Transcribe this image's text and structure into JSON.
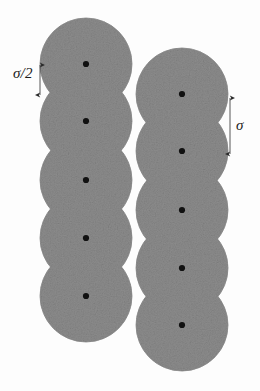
{
  "figure": {
    "canvas": {
      "width": 260,
      "height": 391,
      "background": "#fdfdfd"
    },
    "sphere": {
      "radius": 46,
      "fill_color": "#8c8c8c",
      "edge_color": "#8c8c8c",
      "center_dot_color": "#111111",
      "center_dot_radius": 3.1,
      "texture": "speckled-gray-noise"
    },
    "chains": [
      {
        "name": "left-chain",
        "center_x": 86,
        "bond_length": 58,
        "sphere_count": 5,
        "centers_y": [
          64,
          121,
          180,
          238,
          296
        ]
      },
      {
        "name": "right-chain",
        "center_x": 182,
        "bond_length": 58,
        "sphere_count": 5,
        "offset_from_left_chain_y": 30,
        "centers_y": [
          94,
          151,
          210,
          268,
          325
        ]
      }
    ],
    "annotations": [
      {
        "name": "sigma-half-dimension",
        "label": "σ/2",
        "meaning": "half the sphere diameter, bond overlap spacing",
        "label_x": 13,
        "label_y": 66,
        "line_x": 40,
        "line_y_top": 64,
        "line_y_bottom": 96,
        "color": "#2b2b2b",
        "arrowheads": "both"
      },
      {
        "name": "sigma-dimension",
        "label": "σ",
        "meaning": "sphere diameter",
        "label_x": 236,
        "label_y": 118,
        "line_x": 230,
        "line_y_top": 97,
        "line_y_bottom": 155,
        "color": "#2b2b2b",
        "arrowheads": "both"
      }
    ]
  },
  "chart_data": {
    "type": "scatter",
    "xlabel": "",
    "ylabel": "",
    "xlim": [
      0,
      260
    ],
    "ylim": [
      391,
      0
    ],
    "grid": false,
    "legend": "none",
    "marker": "sphere-outline-with-center-dot",
    "marker_radius_px": 46,
    "series": [
      {
        "name": "left-chain",
        "x": [
          86,
          86,
          86,
          86,
          86
        ],
        "y": [
          64,
          121,
          180,
          238,
          296
        ]
      },
      {
        "name": "right-chain",
        "x": [
          182,
          182,
          182,
          182,
          182
        ],
        "y": [
          94,
          151,
          210,
          268,
          325
        ]
      }
    ],
    "annotations": [
      {
        "text": "σ/2",
        "x": 22,
        "y": 77
      },
      {
        "text": "σ",
        "x": 241,
        "y": 126
      }
    ]
  }
}
